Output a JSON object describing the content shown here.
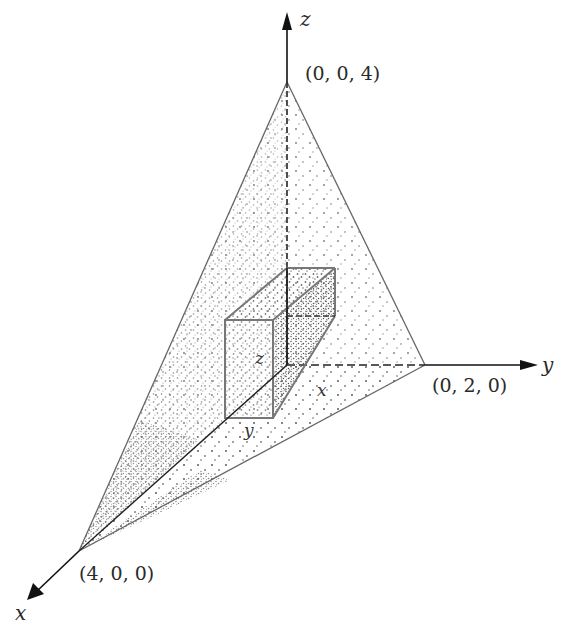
{
  "figure": {
    "axes": {
      "x_label": "x",
      "y_label": "y",
      "z_label": "z"
    },
    "vertices": {
      "x_intercept": "(4, 0, 0)",
      "y_intercept": "(0, 2, 0)",
      "z_intercept": "(0, 0, 4)"
    },
    "box": {
      "height_label": "z",
      "width_label": "y",
      "depth_label": "x"
    },
    "colors": {
      "line": "#555555",
      "axis": "#1a1a1a",
      "stipple": "#6a6a6a",
      "background": "#ffffff"
    }
  }
}
